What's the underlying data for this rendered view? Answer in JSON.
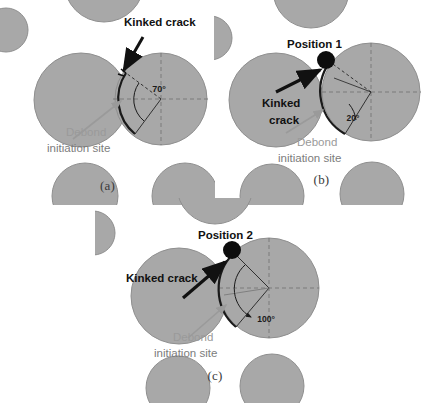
{
  "figure": {
    "background_color": "#ffffff",
    "particle_fill": "#a8a8a8",
    "particle_edge": "#8f8f8f",
    "annotation_color": "#111111",
    "debond_text_color": "#9a9a9a",
    "caption_color": "#3a3a3a"
  },
  "panels": [
    {
      "id": "a",
      "caption": "(a)",
      "kinked_crack_label": "Kinked crack",
      "debond_label_line1": "Debond",
      "debond_label_line2": "initiation site",
      "angle_label": "70°",
      "angle_value": 70,
      "position_label": null
    },
    {
      "id": "b",
      "caption": "(b)",
      "kinked_crack_label_line1": "Kinked",
      "kinked_crack_label_line2": "crack",
      "kinked_crack_label": "Kinked crack",
      "debond_label_line1": "Debond",
      "debond_label_line2": "initiation site",
      "angle_label": "20°",
      "angle_value": 20,
      "position_label": "Position 1"
    },
    {
      "id": "c",
      "caption": "(c)",
      "kinked_crack_label": "Kinked crack",
      "debond_label_line1": "Debond",
      "debond_label_line2": "initiation site",
      "angle_label": "100°",
      "angle_value": 100,
      "position_label": "Position 2"
    }
  ]
}
